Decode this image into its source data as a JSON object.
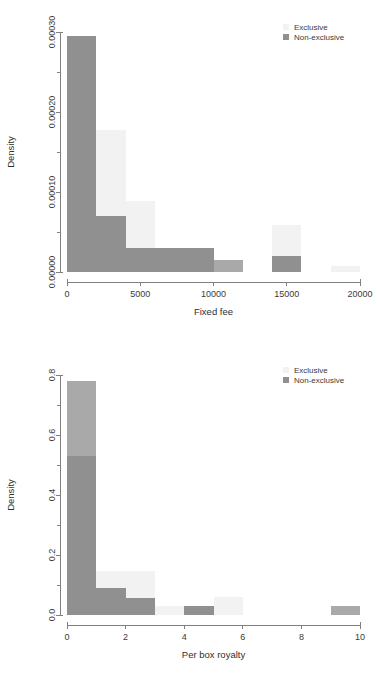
{
  "colors": {
    "exclusive": "#f2f2f2",
    "non_exclusive": "#909090",
    "overlap": "#a9a9a9",
    "axis": "#808080",
    "text": "#3a3a3a"
  },
  "legend": {
    "exclusive_label": "Exclusive",
    "non_exclusive_label": "Non-exclusive"
  },
  "chart_data": [
    {
      "type": "bar",
      "id": "fixed-fee-histogram",
      "title": "",
      "xlabel": "Fixed fee",
      "ylabel": "Density",
      "xlim": [
        0,
        20000
      ],
      "ylim": [
        0,
        0.0003
      ],
      "xticks": [
        0,
        5000,
        10000,
        15000,
        20000
      ],
      "xtick_labels": [
        "0",
        "5000",
        "10000",
        "15000",
        "20000"
      ],
      "yticks": [
        0,
        0.0001,
        0.0002,
        0.0003
      ],
      "ytick_labels": [
        "0.00000",
        "0.00010",
        "0.00020",
        "0.00030"
      ],
      "bin_width": 2000,
      "bin_edges": [
        0,
        2000,
        4000,
        6000,
        8000,
        10000,
        12000,
        14000,
        16000,
        18000,
        20000
      ],
      "grid": false,
      "legend_position": "top-right",
      "series": [
        {
          "name": "Exclusive",
          "color": "#f2f2f2",
          "values": [
            0.000295,
            0.000177,
            8.85e-05,
            2.95e-05,
            2.95e-05,
            0.0,
            0.0,
            5.9e-05,
            0.0,
            7.4e-06
          ]
        },
        {
          "name": "Non-exclusive",
          "color": "#909090",
          "values": [
            0.000295,
            7.05e-05,
            2.95e-05,
            2.95e-05,
            2.95e-05,
            1.48e-05,
            0.0,
            2.05e-05,
            0.0,
            0.0
          ]
        }
      ]
    },
    {
      "type": "bar",
      "id": "per-box-royalty-histogram",
      "title": "",
      "xlabel": "Per box royalty",
      "ylabel": "Density",
      "xlim": [
        0,
        10
      ],
      "ylim": [
        0,
        0.8
      ],
      "xticks": [
        0,
        2,
        4,
        6,
        8,
        10
      ],
      "xtick_labels": [
        "0",
        "2",
        "4",
        "6",
        "8",
        "10"
      ],
      "yticks": [
        0.0,
        0.2,
        0.4,
        0.6,
        0.8
      ],
      "ytick_labels": [
        "0.0",
        "0.2",
        "0.4",
        "0.6",
        "0.8"
      ],
      "bin_width": 1,
      "bin_edges": [
        0,
        1,
        2,
        3,
        4,
        5,
        6,
        7,
        8,
        9,
        10
      ],
      "grid": false,
      "legend_position": "top-right",
      "series": [
        {
          "name": "Exclusive",
          "color": "#f2f2f2",
          "values": [
            0.78,
            0.147,
            0.147,
            0.029,
            0.029,
            0.059,
            0.0,
            0.0,
            0.0,
            0.0
          ]
        },
        {
          "name": "Non-exclusive",
          "color": "#909090",
          "values": [
            0.53,
            0.091,
            0.058,
            0.0,
            0.029,
            0.0,
            0.0,
            0.0,
            0.0,
            0.029
          ]
        }
      ]
    }
  ]
}
